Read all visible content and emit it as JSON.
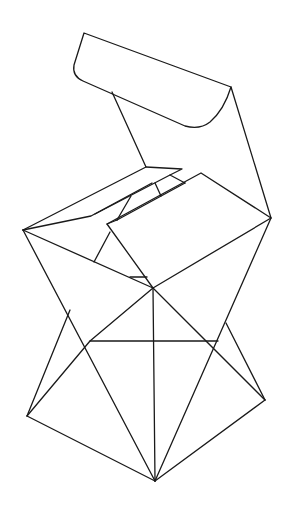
{
  "figure": {
    "background": "#ffffff",
    "stroke_color": "#1a1a1a",
    "width": 294,
    "height": 516
  },
  "paths": {
    "top_flap": "M84,33 L231,87 Q224,110 210,122 Q200,130 185,126 L83,81 Q72,76 74,65 Z",
    "flap_left_edge": "M112,92 L146,167",
    "flap_right_edge": "M231,87 L271,218",
    "inner_flap": "M23,230 L146,167 L182,169 L170,175 L185,183",
    "inner_band_upper": "M23,230 L91,216 L152,183",
    "inner_band_lower": "M95,214 L170,175",
    "inner_band_cross": "M155,183 L161,196",
    "inner_diag": "M131,196 L117,220",
    "inner_connector": "M107,224 L117,220",
    "lid": "M107,224 L201,173 L271,218 L153,288 Z",
    "lid_hinge": "M117,220 L185,183",
    "left_triangle": "M23,230 L153,288",
    "left_notch": "M110,232 L94,262",
    "small_tick": "M130,277 L147,277",
    "left_lower_edge": "M23,230 L155,481",
    "left_kite": "M27,416 L70,310",
    "left_kite_diag": "M27,416 L90,341 L153,288",
    "bottom_left": "M27,416 L155,481",
    "center_vertical": "M153,288 L155,481",
    "horizontal": "M90,341 L218,341",
    "right_diag_a": "M153,288 L265,400",
    "right_diag_b": "M271,218 L155,481",
    "right_notch": "M226,323 L265,400",
    "bottom_right": "M265,400 L155,481"
  }
}
